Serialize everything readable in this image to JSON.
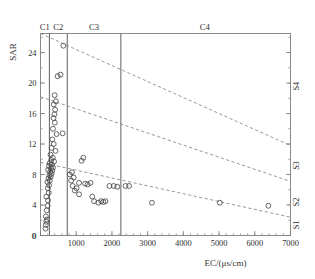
{
  "chart_data": {
    "type": "scatter",
    "title": "",
    "xlabel": "EC/(μs/cm)",
    "ylabel": "SAR",
    "xlim": [
      0,
      7000
    ],
    "ylim": [
      0,
      26.5
    ],
    "grid": false,
    "legend_position": "none",
    "x_ticks": [
      0,
      1000,
      2000,
      3000,
      4000,
      5000,
      6000,
      7000
    ],
    "x_tick_labels": [
      "0",
      "1000",
      "2000",
      "3000",
      "4000",
      "5000",
      "6000",
      "7000"
    ],
    "y_ticks": [
      0,
      4,
      8,
      12,
      16,
      20,
      24
    ],
    "y_tick_labels": [
      "0",
      "4",
      "8",
      "12",
      "16",
      "20",
      "24"
    ],
    "x_minor_tick_step": 200,
    "y_minor_tick_step": 2,
    "salinity_class_labels": [
      "C1",
      "C2",
      "C3",
      "C4"
    ],
    "salinity_class_boundaries_ec": [
      250,
      750,
      2250
    ],
    "salinity_class_label_positions_ec": [
      120,
      500,
      1500,
      4600
    ],
    "sodicity_class_labels": [
      "S1",
      "S2",
      "S3",
      "S4"
    ],
    "sodicity_boundary_lines": [
      {
        "name": "S3/S4",
        "x0": 0,
        "y0": 26.5,
        "x1": 7000,
        "y1": 11.8
      },
      {
        "name": "S2/S3",
        "x0": 0,
        "y0": 18.2,
        "x1": 7000,
        "y1": 7.1
      },
      {
        "name": "S1/S2",
        "x0": 0,
        "y0": 9.6,
        "x1": 7000,
        "y1": 2.4
      }
    ],
    "sodicity_label_positions_sar": [
      1.4,
      4.4,
      9.2,
      19.6
    ],
    "marker": "open-circle",
    "marker_size": 3.1,
    "n_points": 66,
    "points": [
      [
        140,
        0.9
      ],
      [
        150,
        1.4
      ],
      [
        165,
        1.8
      ],
      [
        180,
        2.1
      ],
      [
        150,
        2.5
      ],
      [
        175,
        3.3
      ],
      [
        200,
        3.9
      ],
      [
        210,
        4.6
      ],
      [
        165,
        5.1
      ],
      [
        230,
        5.6
      ],
      [
        205,
        6.2
      ],
      [
        240,
        6.6
      ],
      [
        195,
        7.0
      ],
      [
        260,
        7.2
      ],
      [
        225,
        7.5
      ],
      [
        285,
        7.7
      ],
      [
        250,
        7.9
      ],
      [
        310,
        8.1
      ],
      [
        270,
        8.3
      ],
      [
        330,
        8.5
      ],
      [
        215,
        8.6
      ],
      [
        295,
        8.8
      ],
      [
        350,
        8.9
      ],
      [
        240,
        9.1
      ],
      [
        320,
        9.3
      ],
      [
        260,
        9.5
      ],
      [
        380,
        9.7
      ],
      [
        300,
        9.9
      ],
      [
        345,
        10.2
      ],
      [
        280,
        10.6
      ],
      [
        420,
        11.1
      ],
      [
        310,
        11.5
      ],
      [
        370,
        12.0
      ],
      [
        330,
        12.6
      ],
      [
        450,
        13.3
      ],
      [
        620,
        13.4
      ],
      [
        350,
        14.0
      ],
      [
        400,
        14.8
      ],
      [
        365,
        15.4
      ],
      [
        390,
        15.9
      ],
      [
        410,
        16.5
      ],
      [
        370,
        17.2
      ],
      [
        430,
        17.6
      ],
      [
        395,
        18.4
      ],
      [
        480,
        20.9
      ],
      [
        560,
        21.1
      ],
      [
        640,
        24.9
      ],
      [
        820,
        8.0
      ],
      [
        880,
        8.3
      ],
      [
        860,
        7.2
      ],
      [
        900,
        6.5
      ],
      [
        930,
        7.6
      ],
      [
        960,
        5.9
      ],
      [
        1010,
        6.2
      ],
      [
        1080,
        5.4
      ],
      [
        1150,
        9.8
      ],
      [
        1200,
        10.2
      ],
      [
        1080,
        6.9
      ],
      [
        1250,
        6.8
      ],
      [
        1320,
        6.7
      ],
      [
        1400,
        6.9
      ],
      [
        1450,
        5.1
      ],
      [
        1500,
        4.5
      ],
      [
        1620,
        4.3
      ],
      [
        1700,
        4.5
      ],
      [
        1760,
        4.4
      ],
      [
        1820,
        4.5
      ],
      [
        1930,
        6.5
      ],
      [
        2050,
        6.5
      ],
      [
        2150,
        6.4
      ],
      [
        2380,
        6.5
      ],
      [
        2480,
        6.5
      ],
      [
        3120,
        4.3
      ],
      [
        5020,
        4.3
      ],
      [
        6380,
        3.9
      ]
    ]
  }
}
